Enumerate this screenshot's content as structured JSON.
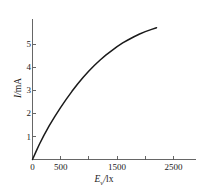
{
  "chart_data": {
    "type": "line",
    "title": "",
    "xlabel": "E_v/lx",
    "ylabel": "I/mA",
    "xlabel_symbol": "E",
    "xlabel_subscript": "v",
    "xlabel_unit": "lx",
    "ylabel_symbol": "I",
    "ylabel_unit": "mA",
    "xlim": [
      0,
      2900
    ],
    "ylim": [
      0,
      6.1
    ],
    "grid": false,
    "legend": null,
    "line_color": "#1a1a1a",
    "axis_color": "#555555",
    "xticks": [
      0,
      500,
      1000,
      1500,
      2000,
      2500
    ],
    "xtick_labels": [
      "0",
      "500",
      "",
      "1500",
      "",
      "2500"
    ],
    "yticks": [
      1,
      2,
      3,
      4,
      5
    ],
    "ytick_labels": [
      "1",
      "2",
      "3",
      "4",
      "5"
    ],
    "series": [
      {
        "name": "photocurrent",
        "x": [
          0,
          60,
          120,
          200,
          300,
          400,
          500,
          600,
          700,
          800,
          900,
          1000,
          1100,
          1200,
          1300,
          1400,
          1500,
          1600,
          1700,
          1800,
          1900,
          2000,
          2100,
          2200
        ],
        "y": [
          0,
          0.33,
          0.65,
          1.04,
          1.48,
          1.88,
          2.26,
          2.62,
          2.96,
          3.28,
          3.57,
          3.84,
          4.09,
          4.32,
          4.53,
          4.72,
          4.9,
          5.06,
          5.2,
          5.33,
          5.45,
          5.55,
          5.64,
          5.72
        ]
      }
    ]
  }
}
